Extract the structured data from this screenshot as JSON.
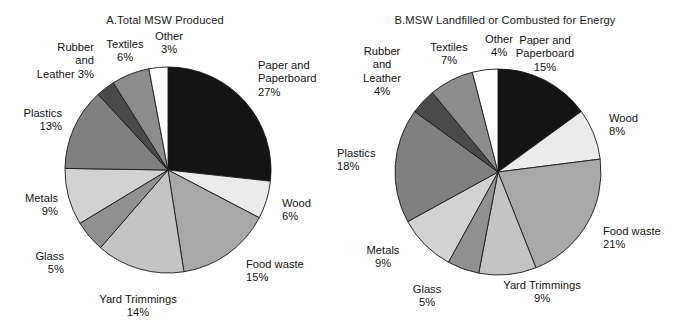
{
  "figure": {
    "background": "#ffffff",
    "panel_count": 2
  },
  "chart_data": [
    {
      "type": "pie",
      "panel": "A",
      "title": "A.Total MSW Produced",
      "xlabel": "",
      "ylabel": "",
      "legend_position": "none",
      "grid": false,
      "start_angle_deg": 0,
      "direction": "clockwise",
      "units": "percent",
      "categories": [
        "Paper and Paperboard",
        "Wood",
        "Food waste",
        "Yard Trimmings",
        "Glass",
        "Metals",
        "Plastics",
        "Rubber and Leather",
        "Textiles",
        "Other"
      ],
      "values": [
        27,
        6,
        15,
        14,
        5,
        9,
        13,
        3,
        6,
        3
      ],
      "colors": [
        "#141414",
        "#ebebeb",
        "#a8a8a8",
        "#c4c4c4",
        "#909090",
        "#d2d2d2",
        "#808080",
        "#4a4a4a",
        "#8c8c8c",
        "#ffffff"
      ],
      "labels": [
        {
          "name": "paper-and-paperboard",
          "text": "Paper and\nPaperboard\n27%",
          "percent": "27%"
        },
        {
          "name": "wood",
          "text": "Wood\n6%",
          "percent": "6%"
        },
        {
          "name": "food-waste",
          "text": "Food waste\n15%",
          "percent": "15%"
        },
        {
          "name": "yard-trimmings",
          "text": "Yard Trimmings\n14%",
          "percent": "14%"
        },
        {
          "name": "glass",
          "text": "Glass\n5%",
          "percent": "5%"
        },
        {
          "name": "metals",
          "text": "Metals\n9%",
          "percent": "9%"
        },
        {
          "name": "plastics",
          "text": "Plastics\n13%",
          "percent": "13%"
        },
        {
          "name": "rubber-and-leather",
          "text": "Rubber\nand\nLeather 3%",
          "percent": "3%"
        },
        {
          "name": "textiles",
          "text": "Textiles\n6%",
          "percent": "6%"
        },
        {
          "name": "other",
          "text": "Other\n3%",
          "percent": "3%"
        }
      ]
    },
    {
      "type": "pie",
      "panel": "B",
      "title": "B.MSW Landfilled or Combusted for Energy",
      "xlabel": "",
      "ylabel": "",
      "legend_position": "none",
      "grid": false,
      "start_angle_deg": 0,
      "direction": "clockwise",
      "units": "percent",
      "categories": [
        "Paper and Paperboard",
        "Wood",
        "Food waste",
        "Yard Trimmings",
        "Glass",
        "Metals",
        "Plastics",
        "Rubber and Leather",
        "Textiles",
        "Other"
      ],
      "values": [
        15,
        8,
        21,
        9,
        5,
        9,
        18,
        4,
        7,
        4
      ],
      "colors": [
        "#141414",
        "#ebebeb",
        "#a8a8a8",
        "#c4c4c4",
        "#909090",
        "#d2d2d2",
        "#808080",
        "#4a4a4a",
        "#8c8c8c",
        "#ffffff"
      ],
      "labels": [
        {
          "name": "paper-and-paperboard",
          "text": "Paper and\nPaperboard\n15%",
          "percent": "15%"
        },
        {
          "name": "wood",
          "text": "Wood\n8%",
          "percent": "8%"
        },
        {
          "name": "food-waste",
          "text": "Food waste\n21%",
          "percent": "21%"
        },
        {
          "name": "yard-trimmings",
          "text": "Yard Trimmings\n9%",
          "percent": "9%"
        },
        {
          "name": "glass",
          "text": "Glass\n5%",
          "percent": "5%"
        },
        {
          "name": "metals",
          "text": "Metals\n9%",
          "percent": "9%"
        },
        {
          "name": "plastics",
          "text": "Plastics\n18%",
          "percent": "18%"
        },
        {
          "name": "rubber-and-leather",
          "text": "Rubber\nand\nLeather\n4%",
          "percent": "4%"
        },
        {
          "name": "textiles",
          "text": "Textiles\n7%",
          "percent": "7%"
        },
        {
          "name": "other",
          "text": "Other\n4%",
          "percent": "4%"
        }
      ]
    }
  ]
}
